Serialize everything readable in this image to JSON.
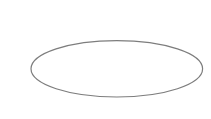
{
  "canvas": {
    "width": 211,
    "height": 119,
    "background": "#ffffff"
  },
  "shapes": [
    {
      "type": "ellipse",
      "cx": 116.8,
      "cy": 68.8,
      "rx": 85.8,
      "ry": 28.2,
      "stroke": "#7d7d7d",
      "stroke_width": 1.2,
      "fill": "none",
      "label": ""
    }
  ]
}
